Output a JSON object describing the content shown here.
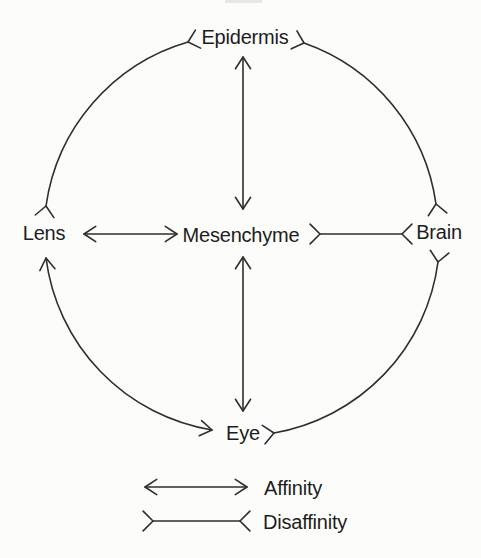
{
  "nodes": {
    "epidermis": {
      "label": "Epidermis"
    },
    "lens": {
      "label": "Lens"
    },
    "mesenchyme": {
      "label": "Mesenchyme"
    },
    "brain": {
      "label": "Brain"
    },
    "eye": {
      "label": "Eye"
    }
  },
  "legend": {
    "affinity": {
      "label": "Affinity",
      "symbol": "double-headed-arrow"
    },
    "disaffinity": {
      "label": "Disaffinity",
      "symbol": "reversed-fork-line"
    }
  },
  "relations": [
    {
      "from": "Epidermis",
      "to": "Mesenchyme",
      "type": "affinity",
      "shape": "straight-vertical"
    },
    {
      "from": "Lens",
      "to": "Mesenchyme",
      "type": "affinity",
      "shape": "straight-horizontal"
    },
    {
      "from": "Mesenchyme",
      "to": "Brain",
      "type": "disaffinity",
      "shape": "straight-horizontal"
    },
    {
      "from": "Mesenchyme",
      "to": "Eye",
      "type": "affinity",
      "shape": "straight-vertical"
    },
    {
      "from": "Epidermis",
      "to": "Lens",
      "type": "disaffinity",
      "shape": "arc"
    },
    {
      "from": "Epidermis",
      "to": "Brain",
      "type": "disaffinity",
      "shape": "arc"
    },
    {
      "from": "Lens",
      "to": "Eye",
      "type": "affinity",
      "shape": "arc"
    },
    {
      "from": "Eye",
      "to": "Brain",
      "type": "disaffinity",
      "shape": "arc"
    }
  ],
  "colors": {
    "background": "#fcfcfb",
    "line": "#2e2e2e",
    "text": "#1d1d1d"
  }
}
